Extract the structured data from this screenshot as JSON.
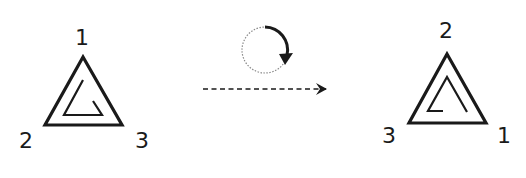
{
  "diagram": {
    "colors": {
      "stroke": "#1a1a1a",
      "dotted": "#888888",
      "background": "#ffffff"
    },
    "before": {
      "label_top": "1",
      "label_bottom_left": "2",
      "label_bottom_right": "3"
    },
    "transform": {
      "rotation_icon": "clockwise-rotation-icon",
      "arrow_icon": "dashed-right-arrow-icon"
    },
    "after": {
      "label_top": "2",
      "label_bottom_left": "3",
      "label_bottom_right": "1"
    }
  }
}
